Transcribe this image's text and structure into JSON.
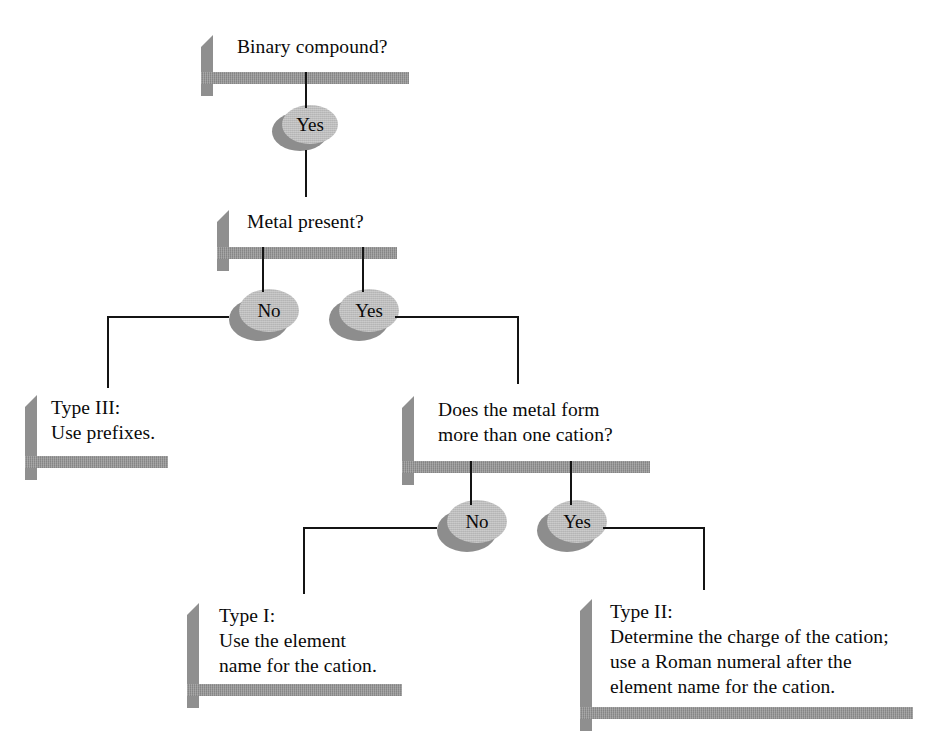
{
  "diagram": {
    "colors": {
      "box_face": "#c5c5c5",
      "box_extrusion": "#8f8f8f",
      "circle_face": "#bcbcbc",
      "circle_shadow": "#8d8d8d",
      "connector": "#141414",
      "background": "#ffffff",
      "text": "#0a0a0a"
    },
    "nodes": {
      "binary_compound": {
        "label": "Binary compound?",
        "type": "question-box"
      },
      "yes_1": {
        "label": "Yes",
        "type": "decision-circle"
      },
      "metal_present": {
        "label": "Metal present?",
        "type": "question-box"
      },
      "no_2": {
        "label": "No",
        "type": "decision-circle"
      },
      "yes_2": {
        "label": "Yes",
        "type": "decision-circle"
      },
      "type_iii": {
        "label": "Type III:\nUse prefixes.",
        "type": "result-box"
      },
      "metal_cation": {
        "label": "Does the metal form\nmore than one cation?",
        "type": "question-box"
      },
      "no_3": {
        "label": "No",
        "type": "decision-circle"
      },
      "yes_3": {
        "label": "Yes",
        "type": "decision-circle"
      },
      "type_i": {
        "label": "Type I:\nUse the element\nname for the cation.",
        "type": "result-box"
      },
      "type_ii": {
        "label": "Type II:\nDetermine the charge of the cation;\nuse a Roman numeral after the\nelement name for the cation.",
        "type": "result-box"
      }
    }
  }
}
